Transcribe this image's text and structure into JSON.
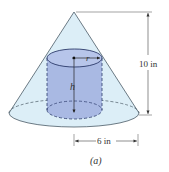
{
  "figure": {
    "caption": "(a)",
    "height_label": "10 in",
    "radius_label": "6 in",
    "cylinder_radius_label": "r",
    "cylinder_height_label": "h"
  },
  "colors": {
    "cone_fill": "#dceef7",
    "cylinder_fill": "#a9b9e3",
    "cylinder_top": "#b7c5ea",
    "line": "#333333"
  }
}
